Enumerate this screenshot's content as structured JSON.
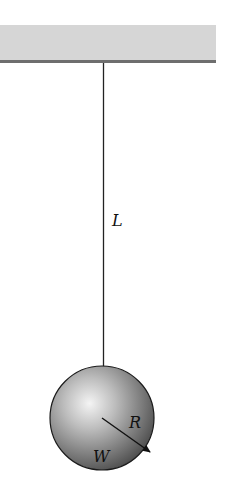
{
  "diagram": {
    "labels": {
      "length": "L",
      "radius": "R",
      "weight": "W"
    },
    "colors": {
      "ceiling_fill": "#d6d6d6",
      "ceiling_edge": "#6e6e6e",
      "string": "#222222",
      "sphere_light": "#f2f2f2",
      "sphere_dark": "#5a5a5a",
      "outline": "#1a1a1a"
    }
  }
}
